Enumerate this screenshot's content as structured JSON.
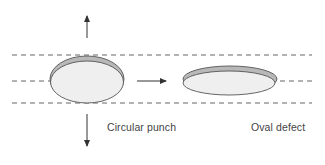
{
  "diagram": {
    "labels": {
      "left": "Circular punch",
      "right": "Oval defect"
    },
    "colors": {
      "line": "#444444",
      "fill_light": "#eeeeee",
      "fill_dark": "#b5b5b5",
      "text": "#444444"
    }
  }
}
